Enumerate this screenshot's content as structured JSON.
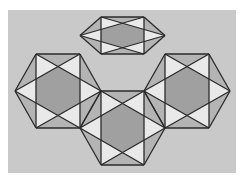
{
  "figure": {
    "colors": {
      "page": "#ffffff",
      "background": "#c9c9c9",
      "square": "#a0a0a0",
      "mid": "#b4b4b4",
      "light": "#e9e9e9",
      "stroke": "#2a2a2a"
    },
    "background_rect": {
      "x": 8,
      "y": 10,
      "w": 228,
      "h": 163
    },
    "hexagons": [
      {
        "name": "top",
        "square": [
          101,
          17,
          144,
          54
        ],
        "points": "101,17 144,17 165,54 144,91 101,91 80,54"
      },
      {
        "name": "left",
        "square": [
          36,
          54,
          80,
          128
        ],
        "points": "36,54 80,54 101,91 80,128 36,128 15,91"
      },
      {
        "name": "right",
        "square": [
          165,
          54,
          209,
          128
        ],
        "points": "165,54 209,54 230,91 209,128 165,128 144,91"
      },
      {
        "name": "bottom",
        "square": [
          101,
          91,
          144,
          165
        ],
        "points": "101,91 144,91 165,128 144,165 101,165 80,128"
      }
    ]
  }
}
